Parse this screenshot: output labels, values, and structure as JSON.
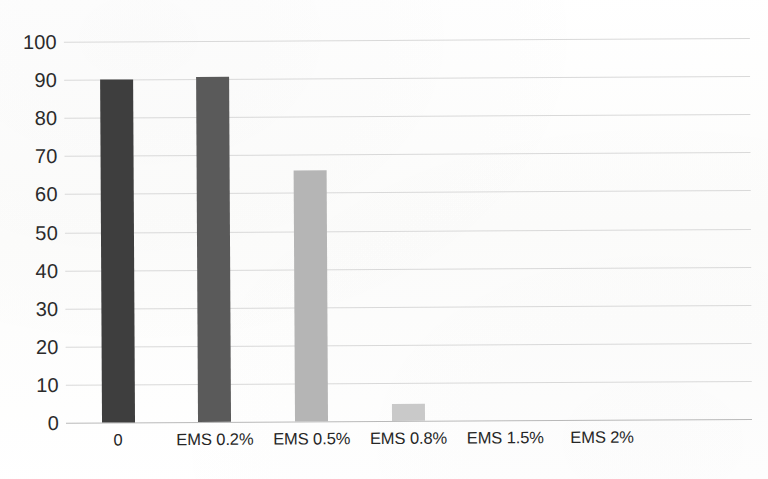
{
  "chart_data": {
    "type": "bar",
    "title": "",
    "subtitle": "",
    "xlabel": "",
    "ylabel": "",
    "categories": [
      "0",
      "EMS 0.2%",
      "EMS 0.5%",
      "EMS 0.8%",
      "EMS 1.5%",
      "EMS 2%"
    ],
    "values": [
      90,
      90.5,
      66,
      4.5,
      0,
      0
    ],
    "ylim": [
      0,
      100
    ],
    "ytick_labels": [
      "0",
      "10",
      "20",
      "30",
      "40",
      "50",
      "60",
      "70",
      "80",
      "90",
      "100"
    ],
    "ytick_values": [
      0,
      10,
      20,
      30,
      40,
      50,
      60,
      70,
      80,
      90,
      100
    ],
    "grid": true,
    "grid_axis": "y",
    "legend": false,
    "legend_position": "none",
    "bar_colors": [
      "#3e3e3e",
      "#5a5a5a",
      "#b5b5b5",
      "#c9c9c9",
      "#c9c9c9",
      "#c9c9c9"
    ],
    "annotations": []
  },
  "style": {
    "background_color": "#fdfdfc",
    "gridline_color": "#d9d9d9",
    "baseline_color": "#b9b9b9",
    "tick_text_color": "#2b2b2b"
  }
}
